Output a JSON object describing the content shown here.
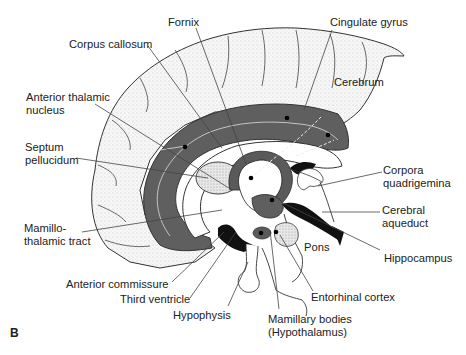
{
  "figure": {
    "panel_letter": "B",
    "labels": {
      "fornix": "Fornix",
      "cingulate_gyrus": "Cingulate gyrus",
      "corpus_callosum": "Corpus callosum",
      "cerebrum": "Cerebrum",
      "anterior_thalamic_nucleus_1": "Anterior thalamic",
      "anterior_thalamic_nucleus_2": "nucleus",
      "septum_pellucidum_1": "Septum",
      "septum_pellucidum_2": "pellucidum",
      "corpora_quadrigemina_1": "Corpora",
      "corpora_quadrigemina_2": "quadrigemina",
      "cerebral_aqueduct_1": "Cerebral",
      "cerebral_aqueduct_2": "aqueduct",
      "mamillothalamic_tract_1": "Mamillo-",
      "mamillothalamic_tract_2": "thalamic tract",
      "pons": "Pons",
      "hippocampus": "Hippocampus",
      "anterior_commissure": "Anterior commissure",
      "entorhinal_cortex": "Entorhinal cortex",
      "third_ventricle": "Third ventricle",
      "hypophysis": "Hypophysis",
      "mamillary_bodies_1": "Mamillary bodies",
      "mamillary_bodies_2": "(Hypothalamus)"
    },
    "colors": {
      "limbic_band": "#5f5f5f",
      "cortex_fill": "#f4f4f4",
      "dark_region": "#111111",
      "leader_line": "#444444",
      "text": "#222222"
    }
  }
}
